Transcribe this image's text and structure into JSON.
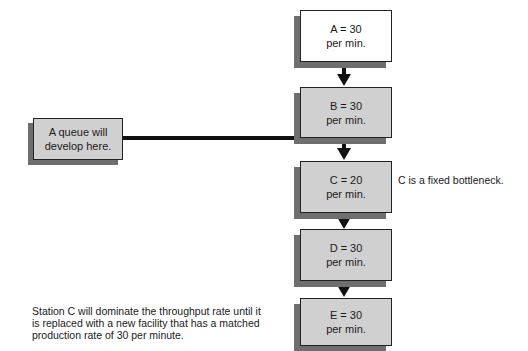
{
  "diagram": {
    "stations": [
      {
        "id": "A",
        "label": "A = 30",
        "rate": "per min.",
        "fill": "#ffffff"
      },
      {
        "id": "B",
        "label": "B = 30",
        "rate": "per min.",
        "fill": "#d0d0d0"
      },
      {
        "id": "C",
        "label": "C = 20",
        "rate": "per min.",
        "fill": "#d0d0d0"
      },
      {
        "id": "D",
        "label": "D = 30",
        "rate": "per min.",
        "fill": "#d0d0d0"
      },
      {
        "id": "E",
        "label": "E = 30",
        "rate": "per min.",
        "fill": "#d0d0d0"
      }
    ],
    "queue_callout": {
      "line1": "A queue will",
      "line2": "develop here."
    },
    "bottleneck_note": "C is a fixed bottleneck.",
    "summary_note": {
      "line1": "Station C will dominate the throughput rate until it",
      "line2": "is replaced with a new facility that has a matched",
      "line3": "production rate of 30 per minute."
    }
  }
}
